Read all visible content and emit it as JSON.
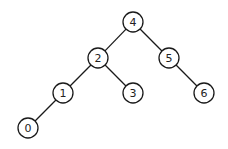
{
  "diagram": {
    "type": "binary-tree",
    "nodes": [
      {
        "id": "n4",
        "label": "4",
        "x": 133,
        "y": 22
      },
      {
        "id": "n2",
        "label": "2",
        "x": 98,
        "y": 58
      },
      {
        "id": "n5",
        "label": "5",
        "x": 169,
        "y": 58
      },
      {
        "id": "n1",
        "label": "1",
        "x": 63,
        "y": 93
      },
      {
        "id": "n3",
        "label": "3",
        "x": 133,
        "y": 93
      },
      {
        "id": "n6",
        "label": "6",
        "x": 204,
        "y": 93
      },
      {
        "id": "n0",
        "label": "0",
        "x": 28,
        "y": 128
      }
    ],
    "edges": [
      {
        "from": "n4",
        "to": "n2"
      },
      {
        "from": "n4",
        "to": "n5"
      },
      {
        "from": "n2",
        "to": "n1"
      },
      {
        "from": "n2",
        "to": "n3"
      },
      {
        "from": "n5",
        "to": "n6"
      },
      {
        "from": "n1",
        "to": "n0"
      }
    ],
    "node_radius": 10
  }
}
